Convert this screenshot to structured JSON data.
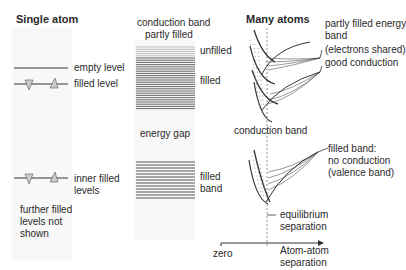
{
  "single_atom": {
    "title": "Single atom",
    "labels": {
      "empty_level": "empty  level",
      "filled_level": "filled level",
      "inner_filled_1": "inner filled",
      "inner_filled_2": "levels",
      "further_1": "further filled",
      "further_2": "levels not",
      "further_3": "shown"
    }
  },
  "band_column": {
    "title_1": "conduction band",
    "title_2": "partly filled",
    "unfilled": "unfilled",
    "filled": "filled",
    "energy_gap": "energy gap",
    "filled_band_1": "filled",
    "filled_band_2": "band"
  },
  "many_atoms": {
    "title": "Many atoms",
    "partly_1": "partly filled energy",
    "partly_2": "band",
    "shared": "(electrons shared)",
    "good": "good conduction",
    "conduction_band": "conduction band",
    "valence_1": "filled band:",
    "valence_2": "no conduction",
    "valence_3": "(valence band)",
    "equilibrium_1": "equilibrium",
    "equilibrium_2": "separation",
    "axis_zero": "zero",
    "axis_label_1": "Atom-atom",
    "axis_label_2": "separation"
  },
  "colors": {
    "line": "#333333",
    "band_dark": "#555555",
    "band_light": "#bbbbbb",
    "panel_bg": "#f7f7f7"
  }
}
